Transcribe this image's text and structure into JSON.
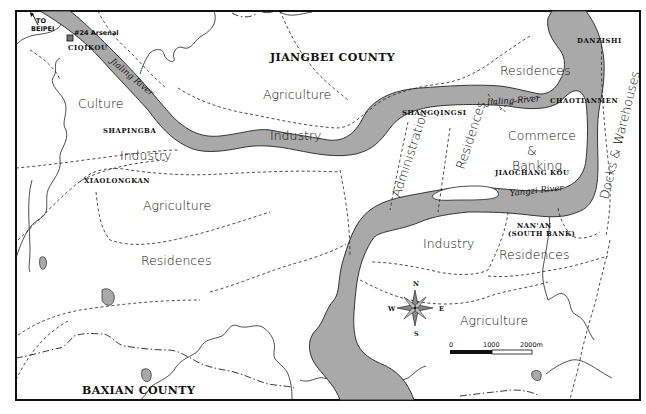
{
  "map": {
    "counties": [
      {
        "id": "jiangbei",
        "label": "JIANGBEI COUNTY"
      },
      {
        "id": "baxian",
        "label": "BAXIAN COUNTY"
      }
    ],
    "rivers": [
      {
        "id": "jialing-upper",
        "label": "Jialing River"
      },
      {
        "id": "jialing-lower",
        "label": "Jialing River"
      },
      {
        "id": "yangzi",
        "label": "Yangzi River"
      }
    ],
    "places": {
      "to_beipei": [
        "TO",
        "BEIPEI"
      ],
      "arsenal": "#24 Arsenal",
      "ciqikou": "CIQIKOU",
      "shapingba": "SHAPINGBA",
      "xiaolongkan": "XIAOLONGKAN",
      "shangqingsi": "SHANGQINGSI",
      "danzishi": "DANZISHI",
      "chaotianmen": "CHAOTIANMEN",
      "jiaochang_kou": "JIAOCHANG KOU",
      "nan_an": [
        "NAN'AN",
        "(SOUTH BANK)"
      ]
    },
    "zones": {
      "culture": "Culture",
      "industry_west": "Industry",
      "agriculture_west": "Agriculture",
      "residences_west": "Residences",
      "agriculture_north": "Agriculture",
      "industry_north": "Industry",
      "residences_northeast": "Residences",
      "administration": "Administration",
      "residences_central": "Residences",
      "commerce_banking": [
        "Commerce",
        "&",
        "Banking"
      ],
      "docks_warehouses": "Docks & Warehouses",
      "industry_south": "Industry",
      "residences_south": "Residences",
      "agriculture_south": "Agriculture"
    },
    "compass": {
      "n": "N",
      "s": "S",
      "e": "E",
      "w": "W"
    },
    "scale_bar": {
      "ticks": [
        "0",
        "1000",
        "2000m"
      ]
    },
    "colors": {
      "water": "#a9a9a9",
      "line": "#222222",
      "background": "#ffffff"
    }
  }
}
